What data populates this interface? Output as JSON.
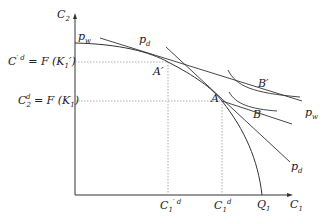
{
  "diagram": {
    "type": "production-possibility-frontier",
    "axes": {
      "y_label": "C",
      "y_label_sub": "2",
      "x_label": "C",
      "x_label_sub": "1"
    },
    "y_ticks": [
      {
        "lhs": "C",
        "lhs_sup": "′ d",
        "rhs": "= F (K",
        "rhs_sub": "1",
        "rhs_end": "′)"
      },
      {
        "lhs": "C",
        "lhs_sub": "2",
        "lhs_sup": "d",
        "rhs": "= F (K",
        "rhs_sub": "1",
        "rhs_end": ")"
      }
    ],
    "x_ticks": [
      {
        "label": "C",
        "sub": "1",
        "sup": "′ d"
      },
      {
        "label": "C",
        "sub": "1",
        "sup": "d"
      },
      {
        "label": "Q",
        "sub": "1"
      }
    ],
    "points": [
      {
        "label": "A′"
      },
      {
        "label": "A"
      },
      {
        "label": "B′"
      },
      {
        "label": "B"
      }
    ],
    "line_labels": {
      "pw_top": {
        "label": "p",
        "sub": "w"
      },
      "pd_top": {
        "label": "p",
        "sub": "d"
      },
      "pw_right": {
        "label": "p",
        "sub": "w"
      },
      "pd_right": {
        "label": "p",
        "sub": "d"
      }
    },
    "colors": {
      "line": "#333333",
      "guide": "#888888"
    }
  }
}
